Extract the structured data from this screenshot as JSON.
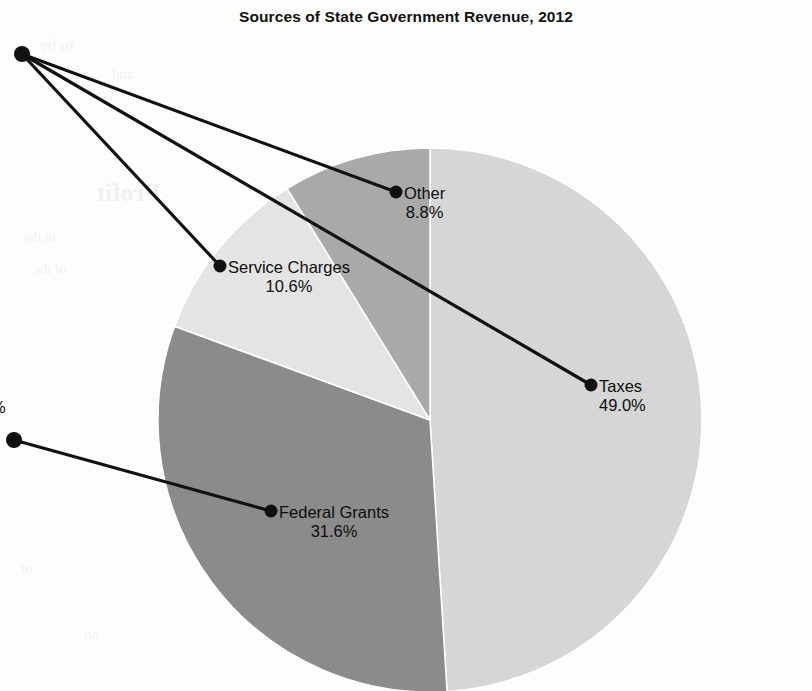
{
  "chart_data": {
    "type": "pie",
    "title": "Sources of State Government Revenue, 2012",
    "categories": [
      "Taxes",
      "Federal Grants",
      "Service Charges",
      "Other"
    ],
    "values": [
      49.0,
      31.6,
      10.6,
      8.8
    ],
    "unit": "%",
    "value_labels": [
      "49.0%",
      "31.6%",
      "10.6%",
      "8.8%"
    ],
    "colors": [
      "#d6d6d6",
      "#8b8b8b",
      "#e4e4e4",
      "#a9a9a9"
    ],
    "legend": "none",
    "labels_position": "leader-lines",
    "start_angle_deg": 0,
    "direction": "clockwise",
    "grid": false,
    "xlabel": "",
    "ylabel": ""
  },
  "chart": {
    "title": "Sources of State Government Revenue, 2012",
    "slices": [
      {
        "name": "Taxes",
        "value": "49.0%",
        "color": "#d6d6d6"
      },
      {
        "name": "Federal Grants",
        "value": "31.6%",
        "color": "#8b8b8b"
      },
      {
        "name": "Service Charges",
        "value": "10.6%",
        "color": "#e4e4e4"
      },
      {
        "name": "Other",
        "value": "8.8%",
        "color": "#a9a9a9"
      }
    ],
    "cropped_edge_label": "%"
  },
  "background_ghost_text": [
    "Profit",
    "of the",
    "to be",
    "and",
    "in the",
    "of",
    "on"
  ]
}
